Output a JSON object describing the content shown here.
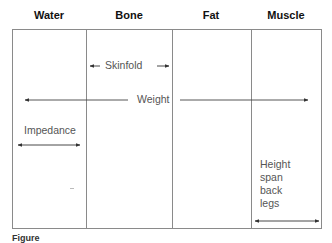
{
  "columns": [
    {
      "label": "Water"
    },
    {
      "label": "Bone"
    },
    {
      "label": "Fat"
    },
    {
      "label": "Muscle"
    }
  ],
  "methods": {
    "skinfold": {
      "label": "Skinfold",
      "spans": [
        "Bone"
      ]
    },
    "weight": {
      "label": "Weight",
      "spans": [
        "Water",
        "Bone",
        "Fat",
        "Muscle"
      ]
    },
    "impedance": {
      "label": "Impedance",
      "spans": [
        "Water"
      ]
    },
    "height_span_back_legs": {
      "label_lines": [
        "Height",
        "span",
        "back",
        "legs"
      ],
      "spans": [
        "Muscle"
      ]
    }
  },
  "caption": {
    "prefix": "Figure",
    "text": "(truncated caption)"
  },
  "colors": {
    "frame": "#8a8a8a",
    "arrow": "#333333",
    "text": "#555555",
    "header": "#111111"
  }
}
